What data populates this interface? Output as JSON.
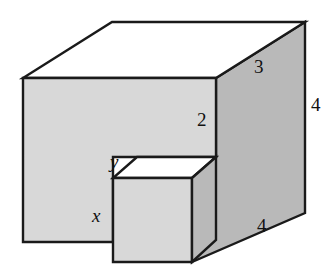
{
  "figure": {
    "name": "notched-rectangular-solid",
    "colors": {
      "outline": "#1a1a1a",
      "top_face_fill": "#ffffff",
      "front_face_fill": "#d8d8d8",
      "side_face_fill": "#b9b9b9",
      "background": "#ffffff"
    },
    "labels": [
      {
        "id": "label-depth-top",
        "text": "3",
        "kind": "number",
        "edge": "top-right receding edge",
        "x": 254,
        "y": 57
      },
      {
        "id": "label-height-right",
        "text": "4",
        "kind": "number",
        "edge": "right vertical edge",
        "x": 311,
        "y": 95
      },
      {
        "id": "label-notch-height",
        "text": "2",
        "kind": "number",
        "edge": "inner notch vertical edge",
        "x": 197,
        "y": 110
      },
      {
        "id": "label-notch-depth",
        "text": "y",
        "kind": "variable",
        "edge": "notch top receding edge",
        "x": 110,
        "y": 152
      },
      {
        "id": "label-notch-width",
        "text": "x",
        "kind": "variable",
        "edge": "front lower horizontal edge",
        "x": 92,
        "y": 206
      },
      {
        "id": "label-length-bottom",
        "text": "4",
        "kind": "number",
        "edge": "bottom-right receding edge",
        "x": 257,
        "y": 216
      }
    ],
    "geometry": {
      "top_face": "112,22 305,22 216,78 23,78",
      "right_face": "305,22 305,213 192,262 192,178 216,157 216,78",
      "front_face": "23,78 216,78 216,157 113,157 113,242 23,242",
      "notch_top_face": "113,178 192,178 216,157 137,157",
      "notch_front_face": "113,178 192,178 192,262 113,262"
    }
  }
}
